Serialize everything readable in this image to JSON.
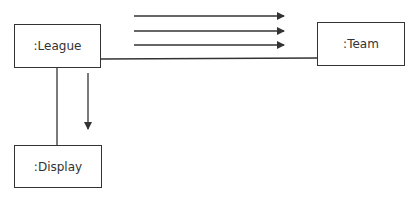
{
  "diagram": {
    "type": "uml-communication",
    "objects": [
      {
        "id": "league",
        "label": ":League"
      },
      {
        "id": "team",
        "label": ":Team"
      },
      {
        "id": "display",
        "label": ":Display"
      }
    ],
    "links": [
      {
        "from": "league",
        "to": "team"
      },
      {
        "from": "league",
        "to": "display"
      }
    ],
    "messages": [
      {
        "link": "league-team",
        "direction": "to-team",
        "count": 3
      },
      {
        "link": "league-display",
        "direction": "to-display",
        "count": 1
      }
    ],
    "colors": {
      "stroke": "#333333",
      "background": "#ffffff"
    }
  }
}
